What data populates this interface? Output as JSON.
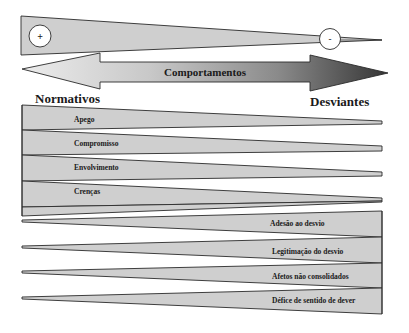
{
  "diagram": {
    "top_scale": {
      "plus_label": "+",
      "minus_label": "-"
    },
    "arrow": {
      "label": "Comportamentos",
      "left_label": "Normativos",
      "right_label": "Desviantes"
    },
    "left_factors": [
      "Apego",
      "Compromisso",
      "Envolvimento",
      "Crenças"
    ],
    "right_factors": [
      "Adesão ao desvio",
      "Legitimação do desvio",
      "Afetos não consolidados",
      "Défice de sentido de dever"
    ]
  },
  "colors": {
    "wedge_fill": "#cfcfcf",
    "outline": "#2a2a2a",
    "arrow_light": "#e6e6e6",
    "arrow_dark": "#3c3c3c",
    "text": "#1a1a1a"
  }
}
